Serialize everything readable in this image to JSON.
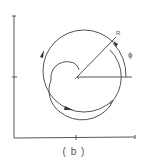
{
  "figure": {
    "caption": "( b )",
    "labels": {
      "radius": "R",
      "angle": "ϕ"
    },
    "colors": {
      "line": "#555555",
      "background": "#ffffff"
    },
    "axes": {
      "origin": [
        14,
        138
      ],
      "x_end": 135,
      "y_end": 16,
      "x_tick": 76,
      "y_tick": 77
    },
    "spiral": {
      "center": [
        77,
        77
      ],
      "outer_radius": 41
    }
  }
}
